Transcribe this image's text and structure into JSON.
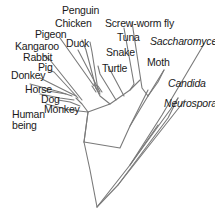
{
  "diagram": {
    "type": "phylogenetic-tree",
    "line_color": "#7a7a7a",
    "text_color": "#1a1a1a",
    "labels": {
      "penguin": "Penguin",
      "chicken": "Chicken",
      "pigeon": "Pigeon",
      "duck": "Duck",
      "kangaroo": "Kangaroo",
      "rabbit": "Rabbit",
      "pig": "Pig",
      "donkey": "Donkey",
      "horse": "Horse",
      "dog": "Dog",
      "monkey": "Monkey",
      "human": "Human\nbeing",
      "screwworm": "Screw-worm fly",
      "tuna": "Tuna",
      "snake": "Snake",
      "turtle": "Turtle",
      "moth": "Moth",
      "saccharomyces": "Saccharomyces",
      "candida": "Candida",
      "neurospora": "Neurospora"
    },
    "italic_taxa": [
      "Saccharomyces",
      "Candida",
      "Neurospora"
    ]
  }
}
